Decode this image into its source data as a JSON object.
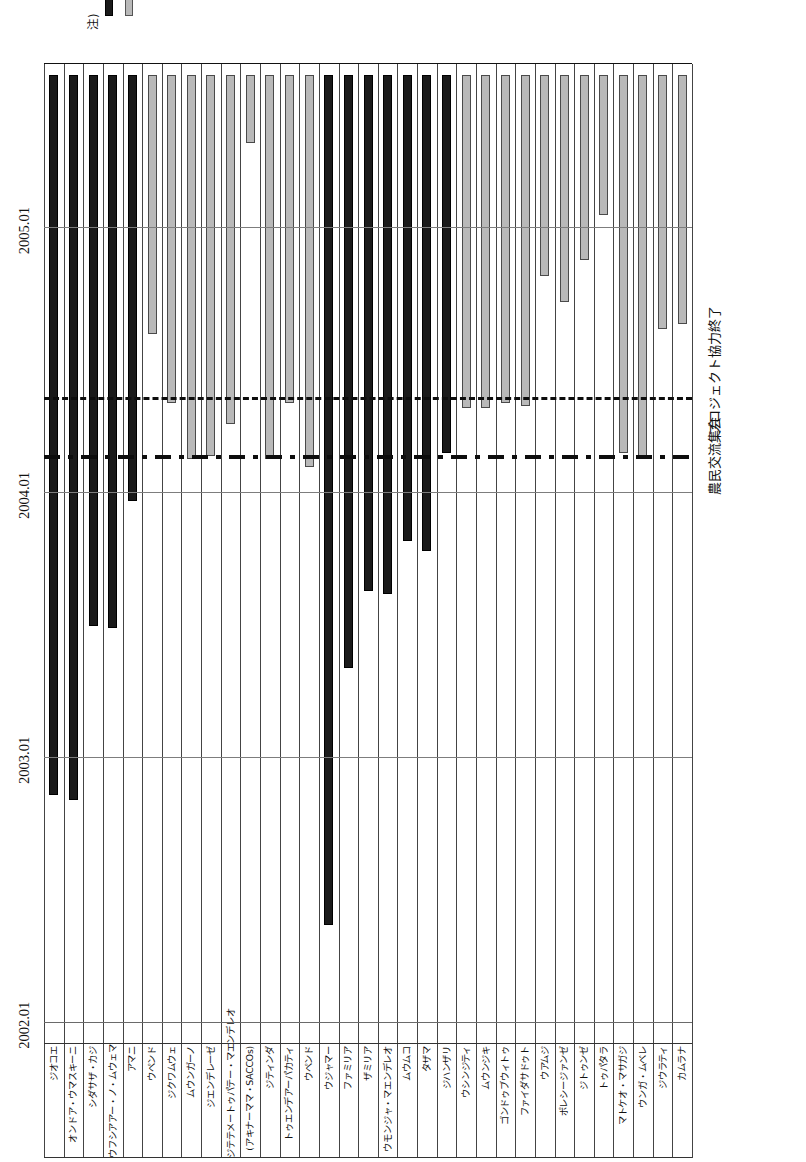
{
  "chart_data": {
    "type": "bar",
    "chart_kind": "gantt",
    "title": "",
    "xlabel": "",
    "ylabel": "",
    "axis_ticks": [
      "2002.01",
      "2003.01",
      "2004.01",
      "2005.01"
    ],
    "axis_tick_values": [
      2002.0,
      2003.0,
      2004.0,
      2005.0
    ],
    "xlim": [
      2001.92,
      2005.62
    ],
    "grid": true,
    "legend_position": "bottom-right",
    "bar_colors": {
      "dark": "#1a1a1a",
      "light": "#b9b9b9"
    },
    "event_markers": [
      {
        "label": "農民交流集会",
        "value": 2004.13,
        "style": "dash-dot"
      },
      {
        "label": "プロジェクト協力終了",
        "value": 2004.35,
        "style": "dashed"
      }
    ],
    "groups": [
      {
        "name": "キシャプハンバ村",
        "rows": [
          {
            "label": "ジオコエ",
            "start": 2002.86,
            "end": 2005.58,
            "color": "dark"
          },
          {
            "label": "オンドア・ウマスキーニ",
            "start": 2002.84,
            "end": 2005.58,
            "color": "dark"
          },
          {
            "label": "シダサザ・カジ",
            "start": 2003.5,
            "end": 2005.58,
            "color": "dark"
          },
          {
            "label": "ウフシアアー・ノ・ムウェマ",
            "start": 2003.49,
            "end": 2005.58,
            "color": "dark"
          },
          {
            "label": "アマニ",
            "start": 2003.97,
            "end": 2005.58,
            "color": "dark"
          },
          {
            "label": "ウペンド",
            "start": 2004.6,
            "end": 2005.58,
            "color": "light"
          },
          {
            "label": "ジクワムウェ",
            "start": 2004.34,
            "end": 2005.58,
            "color": "light"
          },
          {
            "label": "ムウンガーノ",
            "start": 2004.13,
            "end": 2005.58,
            "color": "light"
          },
          {
            "label": "ジエンデレーゼ",
            "start": 2004.14,
            "end": 2005.58,
            "color": "light"
          },
          {
            "label": "ジテテメートゥパテー・マエンデレオ",
            "start": 2004.26,
            "end": 2005.58,
            "color": "light"
          },
          {
            "label": "(アキナーママ・SACCOs)",
            "start": 2005.32,
            "end": 2005.58,
            "color": "light"
          },
          {
            "label": "ジティンダ",
            "start": 2004.13,
            "end": 2005.58,
            "color": "light"
          },
          {
            "label": "トゥエンデアーパカティ",
            "start": 2004.34,
            "end": 2005.58,
            "color": "light"
          }
        ]
      },
      {
        "name": "キタングタ村",
        "rows": [
          {
            "label": "ウペンド",
            "start": 2004.1,
            "end": 2005.58,
            "color": "light"
          },
          {
            "label": "ウジャマー",
            "start": 2002.37,
            "end": 2005.58,
            "color": "dark"
          },
          {
            "label": "ファミリア",
            "start": 2003.34,
            "end": 2005.58,
            "color": "dark"
          },
          {
            "label": "ザミリア",
            "start": 2003.63,
            "end": 2005.58,
            "color": "dark"
          },
          {
            "label": "ウモンジャ・マエンデレオ",
            "start": 2003.62,
            "end": 2005.58,
            "color": "dark"
          },
          {
            "label": "ムウムコ",
            "start": 2003.82,
            "end": 2005.58,
            "color": "dark"
          },
          {
            "label": "タザマ",
            "start": 2003.78,
            "end": 2005.58,
            "color": "dark"
          },
          {
            "label": "ジハンザリ",
            "start": 2004.15,
            "end": 2005.58,
            "color": "dark"
          },
          {
            "label": "ウシンジティ",
            "start": 2004.32,
            "end": 2005.58,
            "color": "light"
          },
          {
            "label": "ムウンジキ",
            "start": 2004.32,
            "end": 2005.58,
            "color": "light"
          },
          {
            "label": "ゴンドゥブウィトゥ",
            "start": 2004.34,
            "end": 2005.58,
            "color": "light"
          },
          {
            "label": "ファイダサドゥト",
            "start": 2004.33,
            "end": 2005.58,
            "color": "light"
          },
          {
            "label": "ウアムジ",
            "start": 2004.82,
            "end": 2005.58,
            "color": "light"
          },
          {
            "label": "ポレシージァンゼ",
            "start": 2004.72,
            "end": 2005.58,
            "color": "light"
          },
          {
            "label": "ジトゥンゼ",
            "start": 2004.88,
            "end": 2005.58,
            "color": "light"
          },
          {
            "label": "トゥパタラ",
            "start": 2005.05,
            "end": 2005.58,
            "color": "light"
          },
          {
            "label": "マトケオ・マサガジ",
            "start": 2004.15,
            "end": 2005.58,
            "color": "light"
          },
          {
            "label": "ウンガ・ムベレ",
            "start": 2004.14,
            "end": 2005.58,
            "color": "light"
          },
          {
            "label": "ジウラティ",
            "start": 2004.62,
            "end": 2005.58,
            "color": "light"
          },
          {
            "label": "カムラナ",
            "start": 2004.64,
            "end": 2005.58,
            "color": "light"
          }
        ]
      }
    ]
  },
  "notes": {
    "prefix": "注)",
    "lines": [
      "いずれも実際に活動を開始したとき以降を示している。",
      "：結成時からSCSRD/JICAが支援。",
      "：結成後にSCSRD/JICAは支援を開始。"
    ]
  }
}
